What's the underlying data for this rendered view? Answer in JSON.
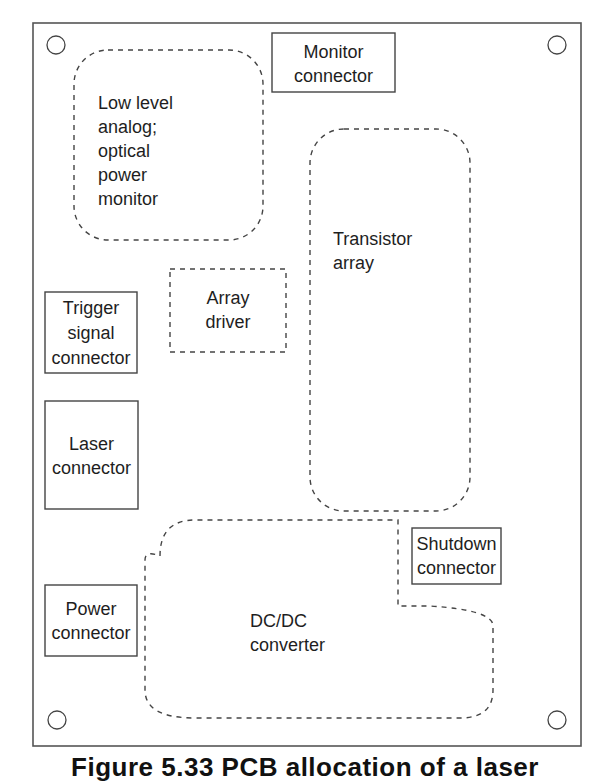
{
  "diagram": {
    "type": "pcb-layout",
    "board": {
      "label": ""
    },
    "blocks": [
      {
        "id": "monitor-connector",
        "lines": [
          "Monitor",
          "connector"
        ],
        "style": "solid"
      },
      {
        "id": "low-level-analog",
        "lines": [
          "Low level",
          "analog;",
          "optical",
          "power",
          "monitor"
        ],
        "style": "dashed-rounded"
      },
      {
        "id": "transistor-array",
        "lines": [
          "Transistor",
          "array"
        ],
        "style": "dashed-rounded"
      },
      {
        "id": "array-driver",
        "lines": [
          "Array",
          "driver"
        ],
        "style": "dashed"
      },
      {
        "id": "trigger-signal-connector",
        "lines": [
          "Trigger",
          "signal",
          "connector"
        ],
        "style": "solid"
      },
      {
        "id": "laser-connector",
        "lines": [
          "Laser",
          "connector"
        ],
        "style": "solid"
      },
      {
        "id": "shutdown-connector",
        "lines": [
          "Shutdown",
          "connector"
        ],
        "style": "solid"
      },
      {
        "id": "power-connector",
        "lines": [
          "Power",
          "connector"
        ],
        "style": "solid"
      },
      {
        "id": "dcdc-converter",
        "lines": [
          "DC/DC",
          "converter"
        ],
        "style": "dashed-rounded"
      }
    ],
    "mounting_holes": 4
  },
  "caption": "Figure 5.33  PCB allocation of a laser"
}
